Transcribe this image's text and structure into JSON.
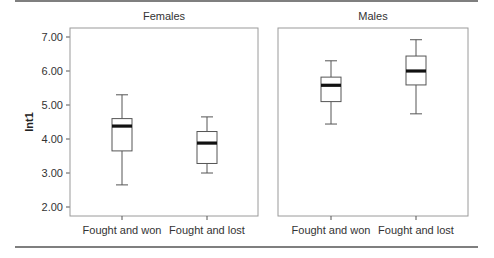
{
  "chart_data": {
    "type": "boxplot",
    "title": "",
    "ylabel": "Int1",
    "xlabel": "",
    "ylim": [
      1.7,
      7.25
    ],
    "yticks": [
      2.0,
      3.0,
      4.0,
      5.0,
      6.0,
      7.0
    ],
    "ytick_labels": [
      "2.00",
      "3.00",
      "4.00",
      "5.00",
      "6.00",
      "7.00"
    ],
    "grid": false,
    "panels": [
      {
        "title": "Females",
        "categories": [
          "Fought and won",
          "Fought and lost"
        ],
        "boxes": [
          {
            "category": "Fought and won",
            "whisker_low": 2.65,
            "q1": 3.65,
            "median": 4.38,
            "q3": 4.6,
            "whisker_high": 5.3
          },
          {
            "category": "Fought and lost",
            "whisker_low": 3.0,
            "q1": 3.28,
            "median": 3.88,
            "q3": 4.22,
            "whisker_high": 4.65
          }
        ]
      },
      {
        "title": "Males",
        "categories": [
          "Fought and won",
          "Fought and lost"
        ],
        "boxes": [
          {
            "category": "Fought and won",
            "whisker_low": 4.44,
            "q1": 5.1,
            "median": 5.58,
            "q3": 5.82,
            "whisker_high": 6.3
          },
          {
            "category": "Fought and lost",
            "whisker_low": 4.74,
            "q1": 5.59,
            "median": 6.0,
            "q3": 6.44,
            "whisker_high": 6.92
          }
        ]
      }
    ]
  },
  "colors": {
    "frame": "#9a9a9a",
    "box_edge": "#555555",
    "median": "#111111",
    "rule": "#555555"
  }
}
